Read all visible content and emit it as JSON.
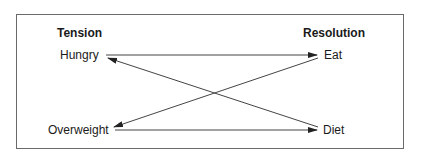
{
  "diagram": {
    "columns": {
      "left_header": "Tension",
      "right_header": "Resolution"
    },
    "nodes": {
      "hungry": "Hungry",
      "overweight": "Overweight",
      "eat": "Eat",
      "diet": "Diet"
    },
    "edges": [
      {
        "from": "hungry",
        "to": "eat"
      },
      {
        "from": "diet",
        "to": "hungry"
      },
      {
        "from": "eat",
        "to": "overweight"
      },
      {
        "from": "overweight",
        "to": "diet"
      }
    ],
    "colors": {
      "line": "#444444",
      "frame": "#6a6a6a",
      "text": "#1a1a1a"
    }
  }
}
